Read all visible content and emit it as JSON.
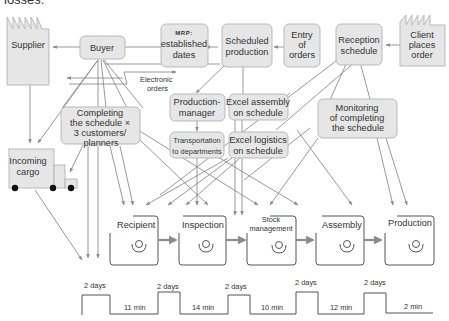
{
  "caption_fragment": "losses.",
  "nodes": {
    "supplier": "Supplier",
    "buyer": "Buyer",
    "mrp_line1": "MRP:",
    "mrp_line2": "established",
    "mrp_line3": "dates",
    "scheduled_line1": "Scheduled",
    "scheduled_line2": "production",
    "entry_line1": "Entry",
    "entry_line2": "of",
    "entry_line3": "orders",
    "reception_line1": "Reception",
    "reception_line2": "schedule",
    "client_line1": "Client",
    "client_line2": "places",
    "client_line3": "order",
    "electronic_line1": "Electronic",
    "electronic_line2": "orders",
    "completing_line1": "Completing",
    "completing_line2": "the schedule ×",
    "completing_line3": "3 customers/",
    "completing_line4": "planners",
    "prodmgr_line1": "Production-",
    "prodmgr_line2": "manager",
    "excel_assembly_line1": "Excel assembly",
    "excel_assembly_line2": "on schedule",
    "transport_line1": "Transportation",
    "transport_line2": "to departments",
    "excel_logistics_line1": "Excel logistics",
    "excel_logistics_line2": "on schedule",
    "monitoring_line1": "Monitoring",
    "monitoring_line2": "of completing",
    "monitoring_line3": "the schedule",
    "cargo_line1": "Incoming",
    "cargo_line2": "cargo"
  },
  "stations": [
    {
      "label": "Recipient"
    },
    {
      "label": "Inspection"
    },
    {
      "label_line1": "Stock",
      "label_line2": "management"
    },
    {
      "label": "Assembly"
    },
    {
      "label": "Production"
    }
  ],
  "timeline": {
    "waits": [
      "2 days",
      "2 days",
      "2 days",
      "2 days",
      "2 days"
    ],
    "process": [
      "11 min",
      "14 min",
      "10 min",
      "12 min",
      "2 min"
    ]
  },
  "colors": {
    "box_fill": "#e6e6e6",
    "box_stroke": "#b9b9b9",
    "line": "#8c8c8c"
  }
}
